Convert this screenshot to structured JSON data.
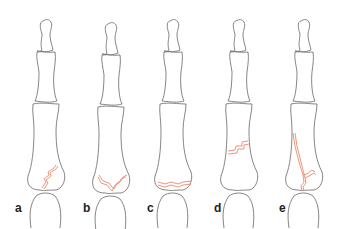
{
  "figure": {
    "colors": {
      "bone_outline": "#777777",
      "fracture_line": "#ea8a70",
      "background": "#ffffff"
    },
    "panels": [
      {
        "label": "a",
        "center_x": 46,
        "fracture": "oblique-base"
      },
      {
        "label": "b",
        "center_x": 111,
        "fracture": "v-shaped-comminuted-base"
      },
      {
        "label": "c",
        "center_x": 173,
        "fracture": "transverse-base"
      },
      {
        "label": "d",
        "center_x": 239,
        "fracture": "transverse-shaft-step"
      },
      {
        "label": "e",
        "center_x": 304,
        "fracture": "long-oblique-spiral-to-base"
      }
    ]
  }
}
